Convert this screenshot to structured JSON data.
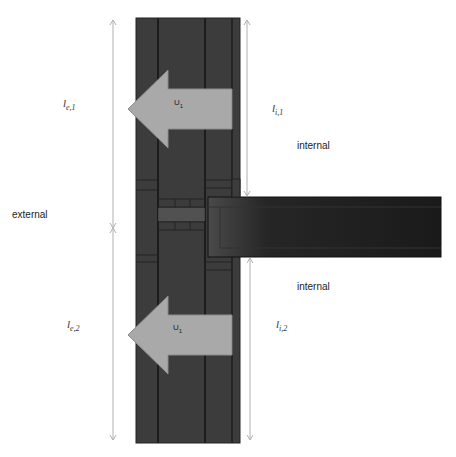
{
  "diagram": {
    "type": "thermal-bridge-junction",
    "regions": {
      "external": "external",
      "internal_top": "internal",
      "internal_bottom": "internal"
    },
    "dimensions": [
      {
        "id": "le1",
        "base": "l",
        "sub": "e,1"
      },
      {
        "id": "le2",
        "base": "l",
        "sub": "e,2"
      },
      {
        "id": "li1",
        "base": "l",
        "sub": "i,1"
      },
      {
        "id": "li2",
        "base": "l",
        "sub": "i,2"
      }
    ],
    "arrows": [
      {
        "id": "u1_top",
        "base": "U",
        "sub": "1"
      },
      {
        "id": "u1_bottom",
        "base": "U",
        "sub": "1"
      }
    ],
    "colors": {
      "wall": "#3b3b3b",
      "wall_line": "#1e1e1e",
      "slab": "#1f1f1f",
      "arrow_fill": "#a9a9a9",
      "arrow_stroke": "#8c8c8c",
      "dim_line": "#b0b0b0"
    }
  }
}
